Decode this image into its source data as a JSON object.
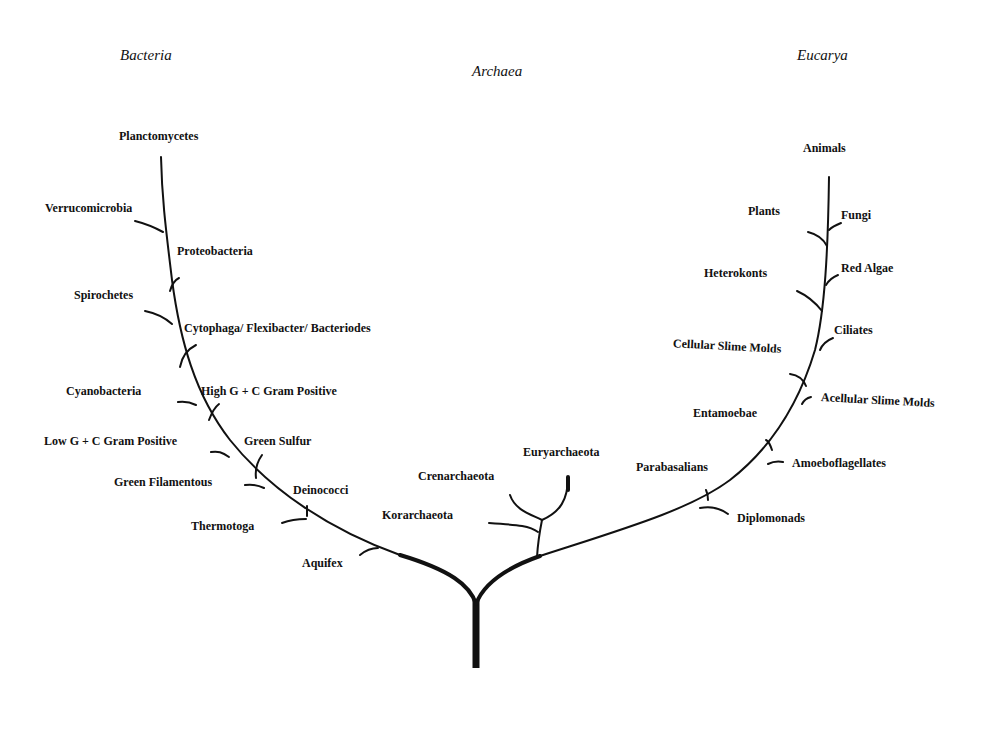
{
  "diagram": {
    "type": "phylogenetic-tree",
    "domains": {
      "bacteria": "Bacteria",
      "archaea": "Archaea",
      "eucarya": "Eucarya"
    },
    "bacteria_taxa": [
      "Planctomycetes",
      "Verrucomicrobia",
      "Proteobacteria",
      "Spirochetes",
      "Cytophaga/ Flexibacter/ Bacteriodes",
      "Cyanobacteria",
      "High G + C Gram Positive",
      "Low G + C Gram Positive",
      "Green Sulfur",
      "Green Filamentous",
      "Deinococci",
      "Thermotoga",
      "Aquifex"
    ],
    "archaea_taxa": [
      "Euryarchaeota",
      "Crenarchaeota",
      "Korarchaeota"
    ],
    "eucarya_taxa": [
      "Animals",
      "Plants",
      "Fungi",
      "Heterokonts",
      "Red Algae",
      "Ciliates",
      "Cellular Slime Molds",
      "Acellular Slime Molds",
      "Entamoebae",
      "Amoeboflagellates",
      "Parabasalians",
      "Diplomonads"
    ],
    "colors": {
      "ink": "#111111",
      "background": "#ffffff"
    }
  }
}
